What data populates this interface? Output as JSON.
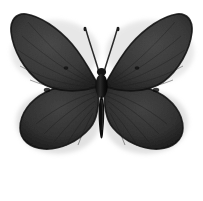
{
  "figure": {
    "background_color": "#ffffff",
    "orientation": "dorsal-spread-wings"
  },
  "specimen": {
    "body_color": "#1a1a1a",
    "forewing_color": "#3c3c3c",
    "hindwing_color": "#343434",
    "wing_edge_color": "#111111",
    "vein_color": "#262626",
    "antenna_color": "#2b2b2b",
    "shadow_color": "#d8d8d8",
    "wing_count": 4,
    "antenna_count": 2
  },
  "thumbnail": {
    "icon_name": "butterfly-thumbnail-icon",
    "color": "#8c8c8c"
  },
  "scale": {
    "label": "1cm",
    "value": 1,
    "unit": "cm",
    "bar_color": "#6e6e6e",
    "bar_length_px": 71,
    "tick_count": 2,
    "label_color": "#4b4b4b"
  }
}
